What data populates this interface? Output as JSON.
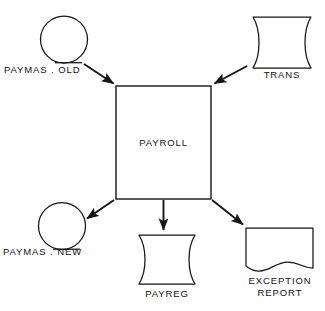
{
  "diagram": {
    "type": "system-flowchart",
    "stroke_color": "#151515",
    "fill_color": "#ffffff",
    "background": "#fefefe",
    "nodes": [
      {
        "id": "paymas-old",
        "label": "PAYMAS . OLD",
        "shape": "magnetic-tape",
        "role": "input"
      },
      {
        "id": "trans",
        "label": "TRANS",
        "shape": "online-storage",
        "role": "input"
      },
      {
        "id": "payroll",
        "label": "PAYROLL",
        "shape": "process",
        "role": "process"
      },
      {
        "id": "paymas-new",
        "label": "PAYMAS . NEW",
        "shape": "magnetic-tape",
        "role": "output"
      },
      {
        "id": "payreg",
        "label": "PAYREG",
        "shape": "online-storage",
        "role": "output"
      },
      {
        "id": "exception-report",
        "label_line1": "EXCEPTION",
        "label_line2": "REPORT",
        "shape": "document",
        "role": "output"
      }
    ],
    "edges": [
      {
        "id": "edge-paymas-old-to-payroll",
        "from": "paymas-old",
        "to": "payroll"
      },
      {
        "id": "edge-trans-to-payroll",
        "from": "trans",
        "to": "payroll"
      },
      {
        "id": "edge-payroll-to-paymas-new",
        "from": "payroll",
        "to": "paymas-new"
      },
      {
        "id": "edge-payroll-to-payreg",
        "from": "payroll",
        "to": "payreg"
      },
      {
        "id": "edge-payroll-to-exception-report",
        "from": "payroll",
        "to": "exception-report"
      }
    ]
  }
}
